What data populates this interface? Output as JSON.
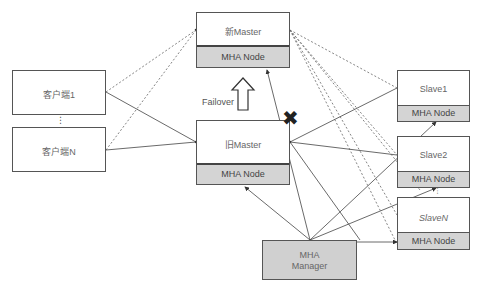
{
  "diagram": {
    "new_master": {
      "label": "新Master",
      "node": "MHA Node"
    },
    "old_master": {
      "label": "旧Master",
      "node": "MHA Node"
    },
    "clients": [
      {
        "label": "客户端1"
      },
      {
        "label": "客户端N"
      }
    ],
    "client_ellipsis": "⋮",
    "slaves": [
      {
        "label": "Slave1",
        "node": "MHA Node"
      },
      {
        "label": "Slave2",
        "node": "MHA Node"
      },
      {
        "label": "SlaveN",
        "node": "MHA Node"
      }
    ],
    "slave_ellipsis": "⋮",
    "manager": {
      "line1": "MHA",
      "line2": "Manager"
    },
    "failover_label": "Failover",
    "failed_mark": "✖"
  }
}
